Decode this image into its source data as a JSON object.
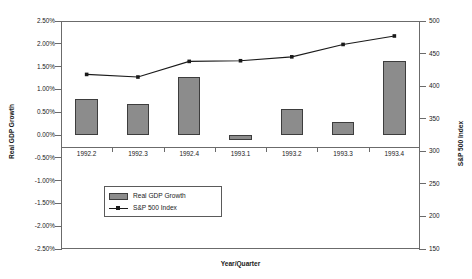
{
  "chart_data": {
    "type": "bar",
    "title": "",
    "xlabel": "Year/Quarter",
    "ylabel": "Real GDP Growth",
    "y2label": "S&P 500 Index",
    "categories": [
      "1992.2",
      "1992.3",
      "1992.4",
      "1993.1",
      "1993.2",
      "1993.3",
      "1993.4"
    ],
    "ylim": [
      -2.5,
      2.5
    ],
    "y2lim": [
      150,
      500
    ],
    "grid": false,
    "legend_position": "inside-lower-left",
    "left_ticks": [
      "2.50%",
      "2.00%",
      "1.50%",
      "1.00%",
      "0.50%",
      "0.00%",
      "-0.50%",
      "-1.00%",
      "-1.50%",
      "-2.00%",
      "-2.50%"
    ],
    "left_tick_values": [
      2.5,
      2.0,
      1.5,
      1.0,
      0.5,
      0.0,
      -0.5,
      -1.0,
      -1.5,
      -2.0,
      -2.5
    ],
    "right_ticks": [
      "500",
      "450",
      "400",
      "350",
      "300",
      "250",
      "200",
      "150"
    ],
    "right_tick_values": [
      500,
      450,
      400,
      350,
      300,
      250,
      200,
      150
    ],
    "series": [
      {
        "name": "Real GDP Growth",
        "type": "bar",
        "axis": "left",
        "unit": "%",
        "color": "#8c8c8c",
        "border_color": "#3d3d3d",
        "values": [
          0.8,
          0.67,
          1.27,
          -0.1,
          0.58,
          0.28,
          1.62
        ]
      },
      {
        "name": "S&P 500 Index",
        "type": "line",
        "axis": "right",
        "color": "#1a1a1a",
        "marker": "square",
        "values": [
          418,
          414,
          438,
          439,
          445,
          464,
          477
        ]
      }
    ]
  },
  "legend": {
    "items": [
      {
        "label": "Real GDP Growth",
        "swatch": "bar-swatch"
      },
      {
        "label": "S&P 500 Index",
        "swatch": "line-marker-swatch"
      }
    ]
  }
}
